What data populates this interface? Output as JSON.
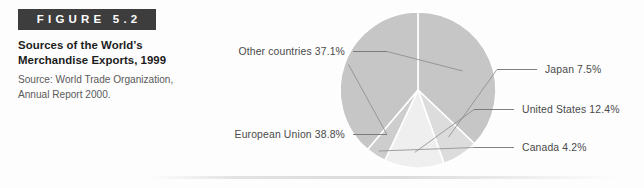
{
  "figure": {
    "banner_label": "FIGURE 5.2",
    "banner_color": "#3d3d3d",
    "title_line_1": "Sources of the World’s",
    "title_line_2": "Merchandise Exports, 1999",
    "source_line_1": "Source: World Trade Organization,",
    "source_line_2": "Annual Report 2000."
  },
  "chart_data": {
    "type": "pie",
    "title": "Sources of the World’s Merchandise Exports, 1999",
    "subtitle": "Source: World Trade Organization, Annual Report 2000.",
    "unit": "%",
    "legend_position": "callout-labels",
    "grid": false,
    "start_angle_deg": -90,
    "direction": "clockwise",
    "categories": [
      "Other countries",
      "Japan",
      "United States",
      "Canada",
      "European Union"
    ],
    "values": [
      37.1,
      7.5,
      12.4,
      4.2,
      38.8
    ],
    "colors": [
      "#c6c6c6",
      "#dcdcdc",
      "#efefef",
      "#cdcdcd",
      "#c6c6c6"
    ],
    "labels": [
      {
        "key": "other-countries",
        "text": "Other countries 37.1%",
        "value": 37.1,
        "side": "left",
        "color": "#c6c6c6"
      },
      {
        "key": "japan",
        "text": "Japan 7.5%",
        "value": 7.5,
        "side": "right",
        "color": "#dcdcdc"
      },
      {
        "key": "united-states",
        "text": "United States 12.4%",
        "value": 12.4,
        "side": "right",
        "color": "#efefef"
      },
      {
        "key": "canada",
        "text": "Canada 4.2%",
        "value": 4.2,
        "side": "right",
        "color": "#cdcdcd"
      },
      {
        "key": "european-union",
        "text": "European Union 38.8%",
        "value": 38.8,
        "side": "left",
        "color": "#c6c6c6"
      }
    ]
  }
}
